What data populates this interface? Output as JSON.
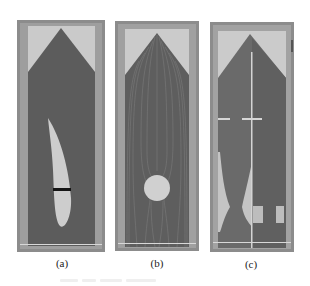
{
  "figure": {
    "panels": [
      {
        "id": "a",
        "label": "(a)",
        "obstacle": "curved-blade with dark slit"
      },
      {
        "id": "b",
        "label": "(b)",
        "obstacle": "circular cylinder with streamlines"
      },
      {
        "id": "c",
        "label": "(c)",
        "obstacle": "nozzle-shaped channel with center line and side notches"
      }
    ],
    "caption": "",
    "colors": {
      "frame": "#8a8a8a",
      "frame_inner": "#9c9c9c",
      "channel_dark": "#5a5a5a",
      "background_light": "#c9c9c9",
      "obstacle": "#cfcfcf",
      "slit": "#111111",
      "streamline": "#7a7a7a"
    }
  }
}
